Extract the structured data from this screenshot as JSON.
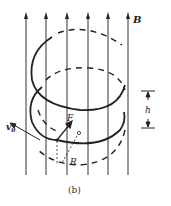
{
  "figure": {
    "caption": "(b)",
    "field_label": "B",
    "velocity_label": "v",
    "velocity_subscript": "0",
    "force_label": "F",
    "radius_label": "R",
    "pitch_label": "h",
    "stroke_color": "#222222",
    "field_lines_x": [
      26,
      46,
      67,
      88,
      108,
      128
    ]
  }
}
